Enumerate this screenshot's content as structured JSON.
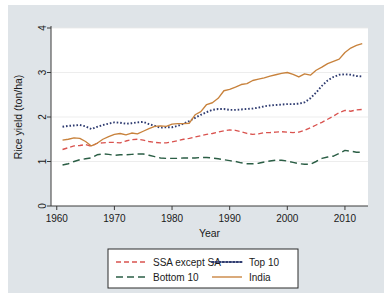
{
  "figure": {
    "background_color": "#dfe4e8",
    "plot_background_color": "#ffffff"
  },
  "chart_data": {
    "type": "line",
    "title": "",
    "xlabel": "Year",
    "ylabel": "Rice yield (ton/ha)",
    "xlim": [
      1959,
      2014
    ],
    "ylim": [
      0,
      4
    ],
    "xticks": [
      1960,
      1970,
      1980,
      1990,
      2000,
      2010
    ],
    "xtick_labels": [
      "1960",
      "1970",
      "1980",
      "1990",
      "2000",
      "2010"
    ],
    "yticks": [
      0,
      1,
      2,
      3,
      4
    ],
    "ytick_labels": [
      "0",
      "1",
      "2",
      "3",
      "4"
    ],
    "grid": "horizontal",
    "legend_position": "below-outside",
    "x": [
      1961,
      1962,
      1963,
      1964,
      1965,
      1966,
      1967,
      1968,
      1969,
      1970,
      1971,
      1972,
      1973,
      1974,
      1975,
      1976,
      1977,
      1978,
      1979,
      1980,
      1981,
      1982,
      1983,
      1984,
      1985,
      1986,
      1987,
      1988,
      1989,
      1990,
      1991,
      1992,
      1993,
      1994,
      1995,
      1996,
      1997,
      1998,
      1999,
      2000,
      2001,
      2002,
      2003,
      2004,
      2005,
      2006,
      2007,
      2008,
      2009,
      2010,
      2011,
      2012,
      2013
    ],
    "series": [
      {
        "name": "SSA except SA",
        "color": "#D9534F",
        "style": "dashed",
        "values": [
          1.27,
          1.31,
          1.35,
          1.36,
          1.38,
          1.34,
          1.41,
          1.42,
          1.43,
          1.43,
          1.42,
          1.46,
          1.49,
          1.5,
          1.48,
          1.45,
          1.43,
          1.42,
          1.42,
          1.44,
          1.47,
          1.5,
          1.52,
          1.55,
          1.58,
          1.61,
          1.63,
          1.66,
          1.69,
          1.71,
          1.7,
          1.67,
          1.63,
          1.61,
          1.62,
          1.65,
          1.65,
          1.66,
          1.67,
          1.66,
          1.65,
          1.66,
          1.7,
          1.76,
          1.82,
          1.88,
          1.95,
          2.02,
          2.1,
          2.15,
          2.13,
          2.16,
          2.17
        ]
      },
      {
        "name": "Top 10",
        "color": "#2E3B70",
        "style": "dotted",
        "values": [
          1.78,
          1.8,
          1.81,
          1.82,
          1.79,
          1.73,
          1.78,
          1.82,
          1.85,
          1.88,
          1.87,
          1.85,
          1.86,
          1.88,
          1.89,
          1.84,
          1.8,
          1.76,
          1.77,
          1.77,
          1.8,
          1.85,
          1.91,
          1.98,
          2.05,
          2.11,
          2.16,
          2.18,
          2.18,
          2.16,
          2.16,
          2.17,
          2.18,
          2.19,
          2.21,
          2.24,
          2.26,
          2.27,
          2.28,
          2.29,
          2.29,
          2.3,
          2.33,
          2.42,
          2.55,
          2.7,
          2.82,
          2.9,
          2.95,
          2.96,
          2.95,
          2.92,
          2.91
        ]
      },
      {
        "name": "Bottom 10",
        "color": "#2B5E45",
        "style": "longdash",
        "values": [
          0.92,
          0.95,
          1.0,
          1.04,
          1.06,
          1.08,
          1.15,
          1.17,
          1.16,
          1.14,
          1.15,
          1.15,
          1.16,
          1.17,
          1.17,
          1.14,
          1.11,
          1.08,
          1.07,
          1.07,
          1.07,
          1.08,
          1.08,
          1.08,
          1.09,
          1.09,
          1.08,
          1.06,
          1.04,
          1.02,
          1.0,
          0.97,
          0.95,
          0.95,
          0.96,
          0.99,
          1.01,
          1.03,
          1.03,
          1.01,
          0.98,
          0.95,
          0.94,
          0.94,
          1.0,
          1.07,
          1.1,
          1.12,
          1.18,
          1.25,
          1.23,
          1.21,
          1.21
        ]
      },
      {
        "name": "India",
        "color": "#C8823C",
        "style": "solid",
        "values": [
          1.48,
          1.5,
          1.53,
          1.52,
          1.45,
          1.35,
          1.41,
          1.5,
          1.56,
          1.61,
          1.63,
          1.6,
          1.64,
          1.62,
          1.68,
          1.74,
          1.79,
          1.8,
          1.79,
          1.84,
          1.85,
          1.85,
          1.86,
          2.05,
          2.12,
          2.28,
          2.32,
          2.42,
          2.59,
          2.62,
          2.67,
          2.73,
          2.75,
          2.82,
          2.85,
          2.88,
          2.92,
          2.95,
          2.98,
          3.0,
          2.96,
          2.9,
          2.97,
          2.94,
          3.05,
          3.12,
          3.2,
          3.25,
          3.3,
          3.45,
          3.55,
          3.61,
          3.65
        ]
      }
    ]
  },
  "legend": {
    "entries": [
      {
        "label": "SSA except SA"
      },
      {
        "label": "Top 10"
      },
      {
        "label": "Bottom 10"
      },
      {
        "label": "India"
      }
    ]
  }
}
